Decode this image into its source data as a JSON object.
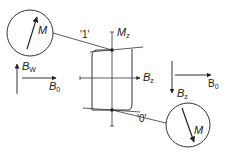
{
  "diagram": {
    "type": "magnetic hysteresis / bit storage diagram",
    "colors": {
      "stroke": "#333333",
      "background": "#ffffff"
    },
    "axes": {
      "vertical_label": "M",
      "vertical_sub": "z",
      "horizontal_label": "B",
      "horizontal_sub": "z"
    },
    "states": [
      {
        "label": "'1'",
        "magnetization_label": "M",
        "direction": "up"
      },
      {
        "label": "'0'",
        "magnetization_label": "M",
        "direction": "down"
      }
    ],
    "left_field": {
      "vertical_label": "B",
      "vertical_sub": "W",
      "horizontal_label": "B",
      "horizontal_sub": "0"
    },
    "right_field": {
      "vertical_label": "B",
      "vertical_sub": "z",
      "horizontal_label": "B",
      "horizontal_sub": "0"
    }
  }
}
